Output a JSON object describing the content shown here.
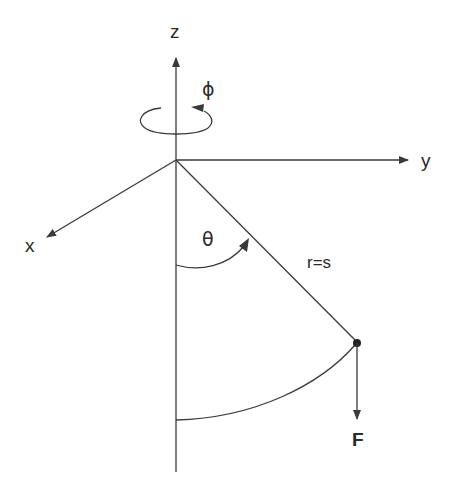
{
  "diagram": {
    "labels": {
      "z_axis": "z",
      "y_axis": "y",
      "x_axis": "x",
      "azimuth": "ϕ",
      "polar": "θ",
      "radius": "r=s",
      "force": "F"
    },
    "colors": {
      "line": "#3a3a3a",
      "text": "#2a2a2a",
      "background": "#ffffff"
    }
  }
}
